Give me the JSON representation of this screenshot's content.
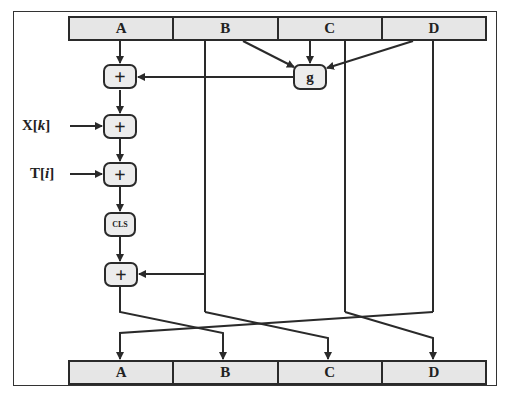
{
  "diagram": {
    "type": "MD5 compression round (block cipher step)",
    "top_register": {
      "cells": [
        "A",
        "B",
        "C",
        "D"
      ]
    },
    "bottom_register": {
      "cells": [
        "A",
        "B",
        "C",
        "D"
      ]
    },
    "nodes": {
      "adder_symbol": "+",
      "g_function": "g",
      "circular_left_shift": "CLS"
    },
    "inputs": {
      "x": {
        "name": "X",
        "open": "[",
        "index": "k",
        "close": "]"
      },
      "t": {
        "name": "T",
        "open": "[",
        "index": "i",
        "close": "]"
      }
    },
    "edges": [
      {
        "from": "A",
        "to": "adder1"
      },
      {
        "from": "B",
        "to": "g"
      },
      {
        "from": "C",
        "to": "g"
      },
      {
        "from": "D",
        "to": "g"
      },
      {
        "from": "g",
        "to": "adder1"
      },
      {
        "from": "adder1",
        "to": "adder2"
      },
      {
        "from": "X[k]",
        "to": "adder2"
      },
      {
        "from": "adder2",
        "to": "adder3"
      },
      {
        "from": "T[i]",
        "to": "adder3"
      },
      {
        "from": "adder3",
        "to": "CLS"
      },
      {
        "from": "CLS",
        "to": "adder4"
      },
      {
        "from": "B",
        "to": "adder4"
      },
      {
        "from": "adder4",
        "to": "B_out"
      },
      {
        "from": "B",
        "to": "C_out"
      },
      {
        "from": "C",
        "to": "D_out"
      },
      {
        "from": "D",
        "to": "A_out"
      }
    ],
    "colors": {
      "register_fill": "#e6e6e6",
      "node_fill": "#ececec",
      "stroke": "#2a2a2a"
    }
  }
}
